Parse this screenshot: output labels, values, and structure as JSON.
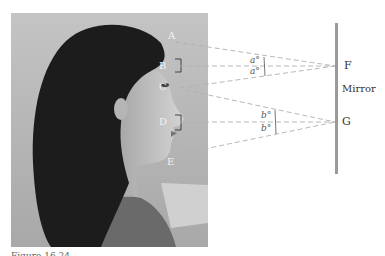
{
  "figure": {
    "caption": "Figure 16.24",
    "colors": {
      "dashed_line": "#b0b0b0",
      "mirror": "#9a9a9a",
      "photo_background": "#b8b8b8",
      "hair": "#1a1a1a",
      "skin": "#c8c8c8",
      "point_label_on_photo": "#f2f2f2",
      "label_text": "#333333"
    },
    "photo": {
      "description": "Side profile photograph of a woman with long dark hair, facing right"
    },
    "points_on_person": [
      {
        "id": "A",
        "label": "A",
        "meaning": "top of head"
      },
      {
        "id": "B",
        "label": "B",
        "meaning": "midpoint between head top and eyes"
      },
      {
        "id": "C",
        "label": "C",
        "meaning": "eyes"
      },
      {
        "id": "D",
        "label": "D",
        "meaning": "midpoint between eyes and chin"
      },
      {
        "id": "E",
        "label": "E",
        "meaning": "chin"
      }
    ],
    "mirror": {
      "label": "Mirror",
      "points": [
        {
          "id": "F",
          "label": "F"
        },
        {
          "id": "G",
          "label": "G"
        }
      ]
    },
    "angles": {
      "upper": [
        "a°",
        "a°"
      ],
      "lower": [
        "b°",
        "b°"
      ]
    }
  }
}
